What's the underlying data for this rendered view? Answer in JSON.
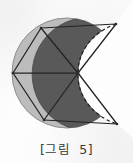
{
  "figure": {
    "caption": "[그림  5]",
    "caption_label": "그림",
    "caption_number": "5",
    "kind": "geometry-diagram",
    "colors": {
      "background": "#fdfdfd",
      "fill_dark": "#595959",
      "fill_light_band": "#b9b9b9",
      "stroke_dark": "#2b2b2b",
      "stroke_outline": "#6f6f6f",
      "dashed_stroke": "#1f1f1f",
      "caption_text": "#3a3a3a"
    },
    "geometry": {
      "circle": {
        "cx": 67,
        "cy": 73,
        "r": 55
      },
      "center_point": {
        "x": 78,
        "y": 73
      },
      "bite_arc_radius": 55,
      "vertices": [
        {
          "name": "top-right",
          "x": 116,
          "y": 24
        },
        {
          "name": "top-left",
          "x": 41,
          "y": 28
        },
        {
          "name": "left",
          "x": 13,
          "y": 73
        },
        {
          "name": "bottom-left",
          "x": 44,
          "y": 120
        },
        {
          "name": "bottom-right",
          "x": 117,
          "y": 124
        }
      ],
      "radial_spokes": 5,
      "dashed_arc": "from top-right vertex through center to bottom-right vertex"
    }
  }
}
